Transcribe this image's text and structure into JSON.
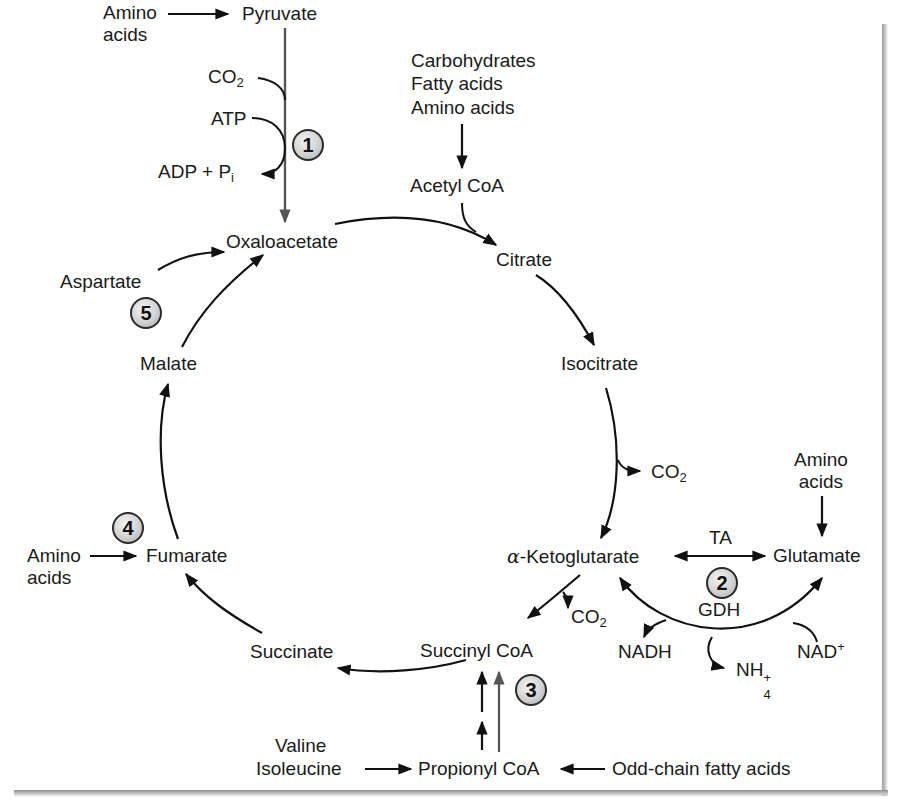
{
  "diagram": {
    "type": "metabolic-pathway",
    "cycle_intermediates": [
      "Oxaloacetate",
      "Citrate",
      "Isocitrate",
      "α-Ketoglutarate",
      "Succinyl CoA",
      "Succinate",
      "Fumarate",
      "Malate"
    ],
    "labels": {
      "amino_acids_top_1": "Amino",
      "amino_acids_top_2": "acids",
      "pyruvate": "Pyruvate",
      "co2_1": "CO",
      "co2_sub": "2",
      "atp": "ATP",
      "adp_pi": "ADP + P",
      "pi_sub": "i",
      "carbohydrates": "Carbohydrates",
      "fatty_acids": "Fatty acids",
      "amino_acids_acetyl": "Amino acids",
      "acetyl_coa": "Acetyl CoA",
      "oxaloacetate": "Oxaloacetate",
      "citrate": "Citrate",
      "aspartate": "Aspartate",
      "malate": "Malate",
      "isocitrate": "Isocitrate",
      "co2_isocitrate": "CO",
      "amino_acids_right_1": "Amino",
      "amino_acids_right_2": "acids",
      "alpha": "α",
      "ketoglutarate": "-Ketoglutarate",
      "ta": "TA",
      "glutamate": "Glutamate",
      "gdh": "GDH",
      "nadh": "NADH",
      "nh4": "NH",
      "nh4_sup": "+",
      "nh4_sub": "4",
      "nad_plus": "NAD",
      "nad_sup": "+",
      "amino_acids_left_1": "Amino",
      "amino_acids_left_2": "acids",
      "fumarate": "Fumarate",
      "succinate": "Succinate",
      "succinyl_coa": "Succinyl CoA",
      "co2_akg": "CO",
      "valine": "Valine",
      "isoleucine": "Isoleucine",
      "propionyl_coa": "Propionyl CoA",
      "odd_chain": "Odd-chain fatty acids"
    },
    "badges": {
      "b1": "1",
      "b2": "2",
      "b3": "3",
      "b4": "4",
      "b5": "5"
    },
    "colors": {
      "arrow": "#111111",
      "anaplerotic_arrow": "#555555",
      "badge_fill": "#d2d2d2",
      "badge_border": "#2a2a2a",
      "shadow": "#9a9a9a"
    }
  }
}
